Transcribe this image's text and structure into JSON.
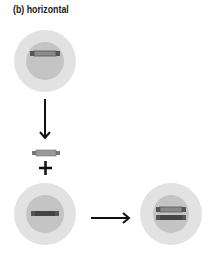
{
  "title": "(b)  horizontal",
  "colors": {
    "outer_cell": "#e2e2e2",
    "inner_nucleus": "#c4c4c4",
    "chromosome_end": "#555555",
    "chromosome_dark": "#444444",
    "chromosome_light": "#8a8a8a",
    "arrow": "#111111"
  },
  "elements": {
    "top_cell": {
      "label": "cell with one chromosome"
    },
    "down_arrow": {
      "label": "arrow down"
    },
    "free_chromosome": {
      "label": "incoming DNA fragment"
    },
    "plus": "+",
    "bottom_left_cell": {
      "label": "recipient cell"
    },
    "right_arrow": {
      "label": "arrow right"
    },
    "bottom_right_cell": {
      "label": "cell with two chromosomes"
    }
  }
}
